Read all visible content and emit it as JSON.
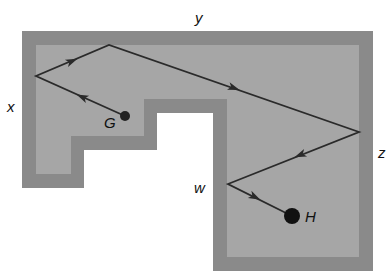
{
  "diagram": {
    "type": "reflection-path",
    "colors": {
      "background": "#ffffff",
      "wall": "#8a8a8a",
      "floor": "#a6a6a6",
      "path": "#2a2a2a",
      "ball": "#111111"
    },
    "labels": {
      "x": "x",
      "y": "y",
      "z": "z",
      "w": "w",
      "G": "G",
      "H": "H"
    },
    "points": {
      "G": [
        125,
        116
      ],
      "x": [
        36,
        76
      ],
      "peak": [
        109,
        45
      ],
      "z": [
        359,
        132
      ],
      "w": [
        228,
        184
      ],
      "H": [
        292,
        216
      ]
    },
    "path_order": [
      "G",
      "x",
      "peak",
      "z",
      "w",
      "H"
    ]
  }
}
